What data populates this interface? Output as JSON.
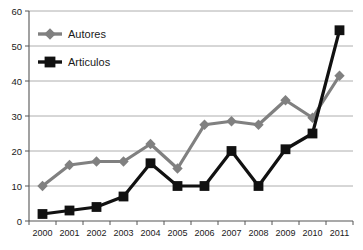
{
  "chart_data": {
    "type": "line",
    "title": "",
    "xlabel": "",
    "ylabel": "",
    "categories": [
      "2000",
      "2001",
      "2002",
      "2003",
      "2004",
      "2005",
      "2006",
      "2007",
      "2008",
      "2009",
      "2010",
      "2011"
    ],
    "series": [
      {
        "name": "Autores",
        "color": "#808080",
        "marker": "diamond",
        "values": [
          10,
          16,
          17,
          17,
          22,
          15,
          27.5,
          28.5,
          27.5,
          34.5,
          29.5,
          41.5
        ]
      },
      {
        "name": "Articulos",
        "color": "#111111",
        "marker": "square",
        "values": [
          2,
          3,
          4,
          7,
          16.5,
          10,
          10,
          20,
          10,
          20.5,
          25,
          54.5
        ]
      }
    ],
    "ylim": [
      0,
      60
    ],
    "yticks": [
      0,
      10,
      20,
      30,
      40,
      50,
      60
    ],
    "ytick_labels": [
      "0",
      "10",
      "20",
      "30",
      "40",
      "50",
      "60"
    ],
    "grid": true,
    "grid_axis": "y",
    "legend_position": "top-left"
  },
  "legend": {
    "entries": [
      {
        "label": "Autores",
        "marker": "diamond-marker",
        "color": "#808080"
      },
      {
        "label": "Articulos",
        "marker": "square-marker",
        "color": "#111111"
      }
    ]
  },
  "axes": {
    "y_tick_labels": [
      "60",
      "50",
      "40",
      "30",
      "20",
      "10",
      "0"
    ],
    "x_tick_labels": [
      "2000",
      "2001",
      "2002",
      "2003",
      "2004",
      "2005",
      "2006",
      "2007",
      "2008",
      "2009",
      "2010",
      "2011"
    ]
  },
  "colors": {
    "background": "#ffffff",
    "gridline": "#9a9a9a",
    "axis": "#555555",
    "series_autores": "#808080",
    "series_articulos": "#111111",
    "text": "#1a1a1a"
  }
}
